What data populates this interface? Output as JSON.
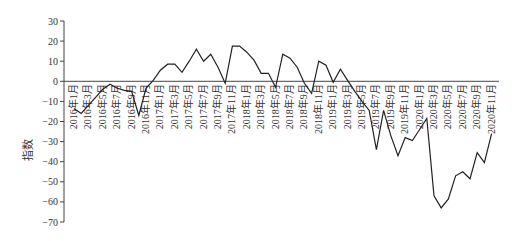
{
  "chart_data": {
    "type": "line",
    "title": "",
    "xlabel": "",
    "ylabel": "指数",
    "ylim": [
      -70,
      30
    ],
    "yticks": [
      30,
      20,
      10,
      0,
      -10,
      -20,
      -30,
      -40,
      -50,
      -60,
      -70
    ],
    "ytick_labels": [
      "30",
      "20",
      "10",
      "0",
      "−10",
      "−20",
      "−30",
      "−40",
      "−50",
      "−60",
      "−70"
    ],
    "grid": false,
    "legend": null,
    "zero_line": true,
    "xtick_labels": [
      "2016年1月",
      "2016年3月",
      "2016年5月",
      "2016年7月",
      "2016年9月",
      "2016年11月",
      "2017年1月",
      "2017年3月",
      "2017年5月",
      "2017年7月",
      "2017年9月",
      "2017年11月",
      "2018年1月",
      "2018年3月",
      "2018年5月",
      "2018年7月",
      "2018年9月",
      "2018年11月",
      "2019年1月",
      "2019年3月",
      "2019年5月",
      "2019年7月",
      "2019年9月",
      "2019年11月",
      "2020年1月",
      "2020年3月",
      "2020年5月",
      "2020年7月",
      "2020年9月",
      "2020年11月"
    ],
    "x": [
      "2016-01",
      "2016-02",
      "2016-03",
      "2016-04",
      "2016-05",
      "2016-06",
      "2016-07",
      "2016-08",
      "2016-09",
      "2016-10",
      "2016-11",
      "2016-12",
      "2017-01",
      "2017-02",
      "2017-03",
      "2017-04",
      "2017-05",
      "2017-06",
      "2017-07",
      "2017-08",
      "2017-09",
      "2017-10",
      "2017-11",
      "2017-12",
      "2018-01",
      "2018-02",
      "2018-03",
      "2018-04",
      "2018-05",
      "2018-06",
      "2018-07",
      "2018-08",
      "2018-09",
      "2018-10",
      "2018-11",
      "2018-12",
      "2019-01",
      "2019-02",
      "2019-03",
      "2019-04",
      "2019-05",
      "2019-06",
      "2019-07",
      "2019-08",
      "2019-09",
      "2019-10",
      "2019-11",
      "2019-12",
      "2020-01",
      "2020-02",
      "2020-03",
      "2020-04",
      "2020-05",
      "2020-06",
      "2020-07",
      "2020-08",
      "2020-09",
      "2020-10",
      "2020-11"
    ],
    "series": [
      {
        "name": "指数",
        "color": "#222222",
        "values": [
          -13.5,
          -16,
          -12,
          -8,
          -4,
          -1.5,
          -3.5,
          -4.5,
          -5,
          -17,
          -3.5,
          0.5,
          5.5,
          8.5,
          8.5,
          4.5,
          10,
          16,
          10,
          13.5,
          7,
          -1,
          17.5,
          17.5,
          14.5,
          10.5,
          4,
          4,
          -3,
          13.5,
          11.5,
          7,
          -1,
          -6,
          10,
          8,
          -0.5,
          6,
          0.5,
          -5,
          -10,
          -14.5,
          -34,
          -14.5,
          -27,
          -37,
          -28,
          -29.5,
          -24,
          -18.5,
          -57,
          -63,
          -58.5,
          -47,
          -45,
          -48.5,
          -35.5,
          -40.5,
          -26
        ]
      }
    ]
  },
  "colors": {
    "axis": "#444444",
    "line": "#222222",
    "text": "#333333"
  }
}
